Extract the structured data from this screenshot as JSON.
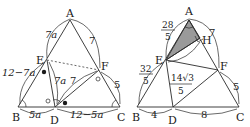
{
  "left_figure": {
    "vertices": {
      "A": "A",
      "B": "B",
      "C": "C",
      "D": "D",
      "E": "E",
      "F": "F"
    },
    "labels": {
      "AE": "7a",
      "AF": "7",
      "EB": "12−7a",
      "ED": "7a",
      "DF": "7",
      "BD": "5a",
      "DC": "12−5a",
      "FC": "5"
    }
  },
  "right_figure": {
    "vertices": {
      "A": "A",
      "B": "B",
      "C": "C",
      "D": "D",
      "E": "E",
      "F": "F",
      "H": "H"
    },
    "labels": {
      "AE_num": "28",
      "AE_den": "5",
      "AF": "7",
      "EB_num": "32",
      "EB_den": "5",
      "EH_num": "14√3",
      "EH_den": "5",
      "FC": "5",
      "BD": "4",
      "DC": "8"
    }
  },
  "colors": {
    "line": "#2a2a2a",
    "shade": "#9a9a9a",
    "dashed": "#555555"
  }
}
